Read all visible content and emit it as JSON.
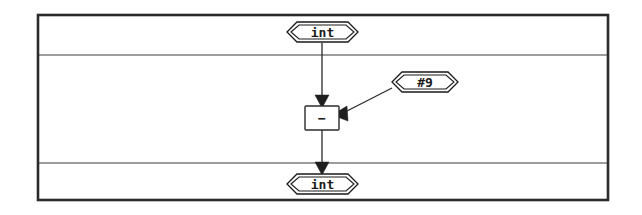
{
  "diagram": {
    "frame": {
      "outer_border_color": "#2b2b2b",
      "divider_color": "#3a3a3a",
      "background": "#ffffff"
    },
    "bands": [
      {
        "name": "input-band",
        "label": ""
      },
      {
        "name": "body-band",
        "label": ""
      },
      {
        "name": "output-band",
        "label": ""
      }
    ],
    "nodes": [
      {
        "id": "input-port",
        "shape": "hexagon",
        "label": "int",
        "band": "input-band",
        "cx": 322,
        "cy": 32
      },
      {
        "id": "constant-node",
        "shape": "hexagon",
        "label": "#9",
        "band": "body-band",
        "cx": 425,
        "cy": 82
      },
      {
        "id": "operator-node",
        "shape": "box",
        "label": "−",
        "band": "body-band",
        "cx": 322,
        "cy": 117
      },
      {
        "id": "output-port",
        "shape": "hexagon",
        "label": "int",
        "band": "output-band",
        "cx": 322,
        "cy": 184
      }
    ],
    "edges": [
      {
        "id": "input-to-operator",
        "from": "input-port",
        "to": "operator-node",
        "arrow": "down"
      },
      {
        "id": "constant-to-operator",
        "from": "constant-node",
        "to": "operator-node",
        "arrow": "left"
      },
      {
        "id": "operator-to-output",
        "from": "operator-node",
        "to": "output-port",
        "arrow": "down"
      }
    ]
  }
}
